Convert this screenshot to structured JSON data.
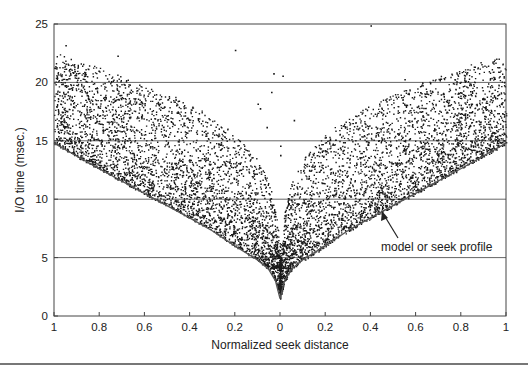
{
  "chart_data": {
    "type": "scatter",
    "title": "",
    "xlabel": "Normalized seek distance",
    "ylabel": "I/O time (msec.)",
    "xlim": [
      -1,
      1
    ],
    "ylim": [
      0,
      25
    ],
    "x_tick_values": [
      -1,
      -0.8,
      -0.6,
      -0.4,
      -0.2,
      0,
      0.2,
      0.4,
      0.6,
      0.8,
      1
    ],
    "x_tick_labels": [
      "1",
      "0.8",
      "0.6",
      "0.4",
      "0.2",
      "0",
      "0.2",
      "0.4",
      "0.6",
      "0.8",
      "1"
    ],
    "y_ticks": [
      0,
      5,
      10,
      15,
      20,
      25
    ],
    "y_tick_labels": [
      "0",
      "5",
      "10",
      "15",
      "20",
      "25"
    ],
    "grid": {
      "horizontal": true,
      "vertical": false,
      "y_values": [
        5,
        10,
        15,
        20
      ]
    },
    "legend": null,
    "series": [
      {
        "name": "measured I/O times",
        "kind": "scatter",
        "color": "#1a1a1a",
        "approx_point_count": 12000,
        "envelope": {
          "abs_x": [
            0,
            0.02,
            0.05,
            0.1,
            0.2,
            0.3,
            0.4,
            0.6,
            0.8,
            1.0
          ],
          "lower": [
            1.5,
            3.0,
            4.0,
            4.8,
            6.0,
            7.3,
            8.4,
            10.5,
            12.6,
            14.8
          ],
          "upper": [
            6.0,
            9.0,
            11.5,
            13.5,
            15.5,
            17.0,
            18.2,
            19.8,
            21.2,
            22.5
          ]
        },
        "outliers": [
          {
            "x": -0.2,
            "y": 22.8
          },
          {
            "x": -0.03,
            "y": 20.8
          },
          {
            "x": 0.01,
            "y": 20.6
          },
          {
            "x": -0.04,
            "y": 19.2
          },
          {
            "x": -0.1,
            "y": 18.2
          },
          {
            "x": -0.09,
            "y": 17.8
          },
          {
            "x": 0.06,
            "y": 16.8
          },
          {
            "x": -0.06,
            "y": 16.2
          },
          {
            "x": 0.4,
            "y": 24.9
          },
          {
            "x": -0.95,
            "y": 23.2
          },
          {
            "x": -0.72,
            "y": 22.3
          },
          {
            "x": 0.55,
            "y": 20.3
          },
          {
            "x": 0.0,
            "y": 14.6
          },
          {
            "x": 0.0,
            "y": 13.8
          }
        ]
      },
      {
        "name": "model or seek profile",
        "kind": "line",
        "color": "#555555",
        "abs_x": [
          0,
          0.02,
          0.05,
          0.1,
          0.2,
          0.3,
          0.4,
          0.6,
          0.8,
          1.0
        ],
        "y": [
          1.5,
          3.0,
          4.0,
          4.8,
          6.0,
          7.3,
          8.4,
          10.5,
          12.6,
          14.8
        ]
      }
    ],
    "annotations": [
      {
        "text": "model or seek profile",
        "arrow_to": {
          "x": 0.45,
          "y": 9.2
        },
        "text_at": {
          "x": 0.45,
          "y": 5.8
        }
      }
    ]
  },
  "figure": {
    "plot_box": {
      "left": 54,
      "top": 24,
      "right": 506,
      "bottom": 316
    },
    "annotation_label": "model or seek profile"
  }
}
